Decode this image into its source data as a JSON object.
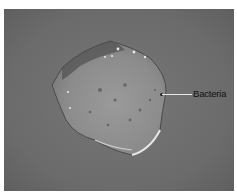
{
  "figure": {
    "annotations": [
      {
        "label": "Bacteria"
      }
    ],
    "colors": {
      "background": "#6e6e6e",
      "border": "#ffffff",
      "label_text": "#111111",
      "pointer_line": "#e8e8e8"
    }
  }
}
